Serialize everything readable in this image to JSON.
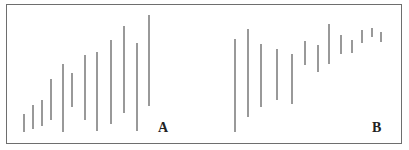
{
  "chart_data": [
    {
      "type": "bar",
      "subtype": "high-low range bars",
      "title": "",
      "panel_label": "A",
      "description": "Range bars widening with rising highs (expanding volatility uptrend)",
      "xlabel": "",
      "ylabel": "",
      "grid": false,
      "legend": null,
      "bars_px": [
        {
          "x": 24,
          "high": 114,
          "low": 132
        },
        {
          "x": 33,
          "high": 105,
          "low": 129
        },
        {
          "x": 42,
          "high": 100,
          "low": 126
        },
        {
          "x": 51,
          "high": 79,
          "low": 120
        },
        {
          "x": 63,
          "high": 64,
          "low": 132
        },
        {
          "x": 72,
          "high": 73,
          "low": 107
        },
        {
          "x": 85,
          "high": 55,
          "low": 120
        },
        {
          "x": 97,
          "high": 52,
          "low": 131
        },
        {
          "x": 111,
          "high": 40,
          "low": 124
        },
        {
          "x": 124,
          "high": 26,
          "low": 113
        },
        {
          "x": 137,
          "high": 43,
          "low": 131
        },
        {
          "x": 149,
          "high": 15,
          "low": 106
        }
      ]
    },
    {
      "type": "bar",
      "subtype": "high-low range bars",
      "title": "",
      "panel_label": "B",
      "description": "Range bars narrowing while prices rise (contracting volatility)",
      "xlabel": "",
      "ylabel": "",
      "grid": false,
      "legend": null,
      "bars_px": [
        {
          "x": 235,
          "high": 39,
          "low": 132
        },
        {
          "x": 248,
          "high": 29,
          "low": 117
        },
        {
          "x": 261,
          "high": 44,
          "low": 107
        },
        {
          "x": 277,
          "high": 49,
          "low": 100
        },
        {
          "x": 292,
          "high": 54,
          "low": 104
        },
        {
          "x": 305,
          "high": 41,
          "low": 65
        },
        {
          "x": 318,
          "high": 45,
          "low": 72
        },
        {
          "x": 329,
          "high": 24,
          "low": 64
        },
        {
          "x": 341,
          "high": 35,
          "low": 54
        },
        {
          "x": 352,
          "high": 40,
          "low": 53
        },
        {
          "x": 362,
          "high": 30,
          "low": 43
        },
        {
          "x": 372,
          "high": 28,
          "low": 37
        },
        {
          "x": 381,
          "high": 32,
          "low": 42
        }
      ]
    }
  ],
  "labels": {
    "panel_a": "A",
    "panel_b": "B"
  },
  "colors": {
    "bar": "#555555",
    "frame": "#6e6e6e",
    "label": "#222222",
    "background": "#ffffff"
  }
}
